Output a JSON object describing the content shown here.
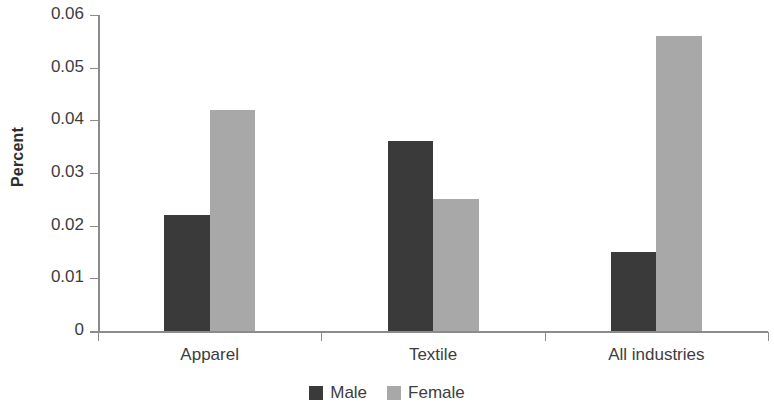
{
  "chart_data": {
    "type": "bar",
    "title": "",
    "xlabel": "",
    "ylabel": "Percent",
    "categories": [
      "Apparel",
      "Textile",
      "All industries"
    ],
    "series": [
      {
        "name": "Male",
        "color": "#3a3a3a",
        "values": [
          0.022,
          0.036,
          0.015
        ]
      },
      {
        "name": "Female",
        "color": "#a8a8a8",
        "values": [
          0.042,
          0.025,
          0.056
        ]
      }
    ],
    "ylim": [
      0,
      0.06
    ],
    "ytick_labels": [
      "0",
      "0.01",
      "0.02",
      "0.03",
      "0.04",
      "0.05",
      "0.06"
    ],
    "ytick_values": [
      0,
      0.01,
      0.02,
      0.03,
      0.04,
      0.05,
      0.06
    ],
    "grid": false,
    "legend_position": "bottom-center",
    "legend_entries": [
      "Male",
      "Female"
    ],
    "annotations": []
  },
  "axis": {
    "y_title": "Percent"
  },
  "legend": {
    "items": [
      {
        "label": "Male"
      },
      {
        "label": "Female"
      }
    ]
  }
}
